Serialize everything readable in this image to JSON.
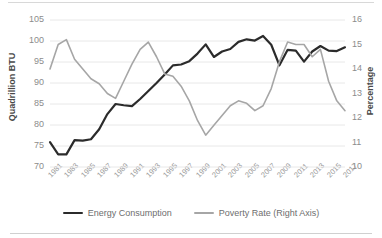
{
  "chart_data": {
    "type": "line",
    "title": "",
    "xlabel": "",
    "ylabel": "Quadrillion BTU",
    "y2label": "Percentage",
    "grid": true,
    "legend_position": "bottom",
    "ylim": [
      70,
      105
    ],
    "y2lim": [
      10,
      16
    ],
    "yticks": [
      "105",
      "100",
      "95",
      "90",
      "85",
      "80",
      "75",
      "70"
    ],
    "y2ticks": [
      "16",
      "15",
      "14",
      "13",
      "12",
      "11",
      "10"
    ],
    "x": [
      1981,
      1982,
      1983,
      1984,
      1985,
      1986,
      1987,
      1988,
      1989,
      1990,
      1991,
      1992,
      1993,
      1994,
      1995,
      1996,
      1997,
      1998,
      1999,
      2000,
      2001,
      2002,
      2003,
      2004,
      2005,
      2006,
      2007,
      2008,
      2009,
      2010,
      2011,
      2012,
      2013,
      2014,
      2015,
      2016,
      2017
    ],
    "xticks": [
      "1981",
      "1983",
      "1985",
      "1987",
      "1989",
      "1991",
      "1993",
      "1995",
      "1997",
      "1999",
      "2001",
      "2003",
      "2005",
      "2007",
      "2009",
      "2011",
      "2013",
      "2015",
      "2017"
    ],
    "series": [
      {
        "name": "Energy Consumption",
        "axis": "left",
        "color": "#2b2b2b",
        "units": "Quadrillion BTU",
        "values": [
          75.9,
          73.0,
          73.0,
          76.4,
          76.3,
          76.6,
          79.0,
          82.6,
          85.0,
          84.7,
          84.5,
          86.2,
          88.1,
          90.0,
          92.0,
          94.2,
          94.4,
          95.2,
          97.0,
          99.2,
          96.2,
          97.5,
          98.1,
          99.8,
          100.4,
          100.1,
          101.2,
          99.1,
          94.2,
          97.9,
          97.7,
          95.1,
          97.5,
          98.8,
          97.7,
          97.6,
          98.5
        ]
      },
      {
        "name": "Poverty Rate (Right Axis)",
        "axis": "right",
        "color": "#a6a6a6",
        "units": "Percentage",
        "values": [
          14.0,
          15.0,
          15.2,
          14.4,
          14.0,
          13.6,
          13.4,
          13.0,
          12.8,
          13.5,
          14.2,
          14.8,
          15.1,
          14.5,
          13.8,
          13.7,
          13.3,
          12.7,
          11.9,
          11.3,
          11.7,
          12.1,
          12.5,
          12.7,
          12.6,
          12.3,
          12.5,
          13.2,
          14.3,
          15.1,
          15.0,
          15.0,
          14.5,
          14.8,
          13.5,
          12.7,
          12.3
        ]
      }
    ]
  },
  "legend": {
    "items": [
      {
        "label": "Energy Consumption",
        "color": "#2b2b2b"
      },
      {
        "label": "Poverty Rate (Right Axis)",
        "color": "#a6a6a6"
      }
    ]
  }
}
